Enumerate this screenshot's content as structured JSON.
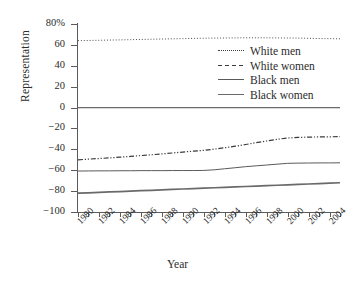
{
  "chart_data": {
    "type": "line",
    "title": "",
    "xlabel": "Year",
    "ylabel": "Representation",
    "grid": false,
    "legend_position": "upper-right-inside",
    "xlim": [
      1980,
      2005
    ],
    "ylim": [
      -100,
      80
    ],
    "ytick_labels": [
      "80%",
      "60",
      "40",
      "20",
      "0",
      "-20",
      "-40",
      "-60",
      "-80",
      "-100"
    ],
    "ytick_values": [
      80,
      60,
      40,
      20,
      0,
      -20,
      -40,
      -60,
      -80,
      -100
    ],
    "xtick_labels": [
      "1980",
      "1982",
      "1984",
      "1986",
      "1988",
      "1990",
      "1992",
      "1994",
      "1996",
      "1998",
      "2000",
      "2002",
      "2004"
    ],
    "xtick_values": [
      1980,
      1982,
      1984,
      1986,
      1988,
      1990,
      1992,
      1994,
      1996,
      1998,
      2000,
      2002,
      2004
    ],
    "x": [
      1980,
      1981,
      1982,
      1983,
      1984,
      1985,
      1986,
      1987,
      1988,
      1989,
      1990,
      1991,
      1992,
      1993,
      1994,
      1995,
      1996,
      1997,
      1998,
      1999,
      2000,
      2001,
      2002,
      2003,
      2004,
      2005
    ],
    "series": [
      {
        "name": "White men",
        "style": "dotted",
        "color": "#3a3a3a",
        "values": [
          64.0,
          64.2,
          64.4,
          64.6,
          64.8,
          65.0,
          65.2,
          65.4,
          65.6,
          65.8,
          66.0,
          66.2,
          66.4,
          66.5,
          66.6,
          66.7,
          66.8,
          66.8,
          66.8,
          66.7,
          66.6,
          66.5,
          66.3,
          66.1,
          66.0,
          65.8
        ]
      },
      {
        "name": "White women",
        "style": "dash-dot",
        "color": "#3a3a3a",
        "values": [
          -50.0,
          -49.4,
          -48.8,
          -48.2,
          -47.5,
          -46.8,
          -46.0,
          -45.2,
          -44.4,
          -43.5,
          -42.6,
          -41.8,
          -41.0,
          -39.8,
          -38.5,
          -37.0,
          -35.4,
          -33.6,
          -32.0,
          -30.4,
          -29.2,
          -28.6,
          -28.3,
          -28.1,
          -28.0,
          -27.9
        ]
      },
      {
        "name": "Black men",
        "style": "solid-thin",
        "color": "#5a5a5a",
        "values": [
          -60.8,
          -60.7,
          -60.6,
          -60.6,
          -60.5,
          -60.5,
          -60.4,
          -60.4,
          -60.4,
          -60.3,
          -60.3,
          -60.3,
          -60.2,
          -59.6,
          -58.6,
          -57.6,
          -56.6,
          -55.8,
          -55.0,
          -54.2,
          -53.4,
          -53.2,
          -53.1,
          -53.0,
          -53.0,
          -52.9
        ]
      },
      {
        "name": "Black women",
        "style": "solid-thick",
        "color": "#6a6a6a",
        "values": [
          -82.0,
          -81.6,
          -81.2,
          -80.8,
          -80.4,
          -80.0,
          -79.6,
          -79.2,
          -78.8,
          -78.4,
          -78.0,
          -77.6,
          -77.2,
          -76.8,
          -76.4,
          -76.0,
          -75.6,
          -75.2,
          -74.8,
          -74.4,
          -74.0,
          -73.6,
          -73.2,
          -72.8,
          -72.4,
          -72.0
        ]
      }
    ],
    "zero_line": 0
  }
}
